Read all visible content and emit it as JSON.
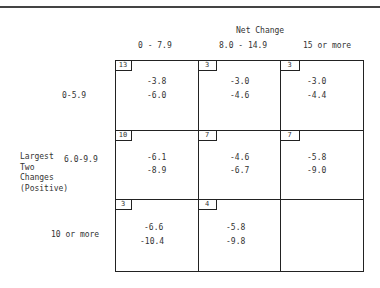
{
  "header": {
    "title": "Net Change",
    "columns": [
      "0 - 7.9",
      "8.0 - 14.9",
      "15 or more"
    ]
  },
  "row_group_label": [
    "Largest",
    "Two",
    "Changes",
    "(Positive)"
  ],
  "rows": [
    {
      "label": "0-5.9",
      "cells": [
        {
          "count": "13",
          "v1": "-3.8",
          "v2": "-6.0"
        },
        {
          "count": "3",
          "v1": "-3.0",
          "v2": "-4.6"
        },
        {
          "count": "3",
          "v1": "-3.0",
          "v2": "-4.4"
        }
      ]
    },
    {
      "label": "6.0-9.9",
      "cells": [
        {
          "count": "10",
          "v1": "-6.1",
          "v2": "-8.9"
        },
        {
          "count": "7",
          "v1": "-4.6",
          "v2": "-6.7"
        },
        {
          "count": "7",
          "v1": "-5.8",
          "v2": "-9.0"
        }
      ]
    },
    {
      "label": "10 or more",
      "cells": [
        {
          "count": "3",
          "v1": "-6.6",
          "v2": "-10.4"
        },
        {
          "count": "4",
          "v1": "-5.8",
          "v2": "-9.8"
        },
        {
          "count": "",
          "v1": "",
          "v2": ""
        }
      ]
    }
  ]
}
